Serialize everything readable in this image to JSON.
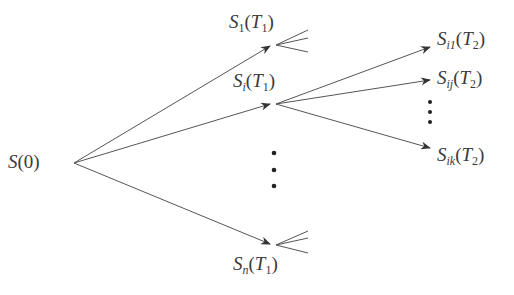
{
  "diagram": {
    "type": "state-tree",
    "colors": {
      "line": "#555555",
      "text": "#3a3a3a",
      "background": "#ffffff"
    },
    "nodes": [
      {
        "id": "root",
        "label": "S(0)",
        "base": "S",
        "sub": "",
        "arg": "0",
        "argsub": ""
      },
      {
        "id": "s1",
        "label": "S1(T1)",
        "base": "S",
        "sub": "1",
        "arg": "T",
        "argsub": "1"
      },
      {
        "id": "si",
        "label": "Si(T1)",
        "base": "S",
        "sub": "i",
        "arg": "T",
        "argsub": "1"
      },
      {
        "id": "sn",
        "label": "Sn(T1)",
        "base": "S",
        "sub": "n",
        "arg": "T",
        "argsub": "1"
      },
      {
        "id": "si1",
        "label": "Si1(T2)",
        "base": "S",
        "sub": "i1",
        "arg": "T",
        "argsub": "2"
      },
      {
        "id": "sij",
        "label": "Sij(T2)",
        "base": "S",
        "sub": "ij",
        "arg": "T",
        "argsub": "2"
      },
      {
        "id": "sik",
        "label": "Sik(T2)",
        "base": "S",
        "sub": "ik",
        "arg": "T",
        "argsub": "2"
      }
    ],
    "edges": [
      {
        "from": "root",
        "to": "s1"
      },
      {
        "from": "root",
        "to": "si"
      },
      {
        "from": "root",
        "to": "sn"
      },
      {
        "from": "si",
        "to": "si1"
      },
      {
        "from": "si",
        "to": "sij"
      },
      {
        "from": "si",
        "to": "sik"
      }
    ],
    "ellipses": [
      "between si and sn (vertical dots)",
      "between sij and sik (vertical dots)"
    ]
  }
}
